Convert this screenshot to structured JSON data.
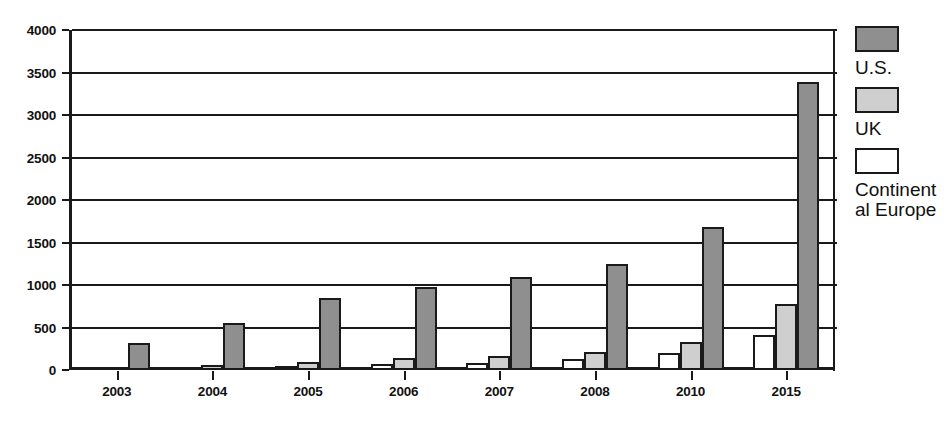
{
  "chart_data": {
    "type": "bar",
    "title": "",
    "subtitle": "",
    "xlabel": "",
    "ylabel": "",
    "categories": [
      "2003",
      "2004",
      "2005",
      "2006",
      "2007",
      "2008",
      "2010",
      "2015"
    ],
    "series": [
      {
        "name": "Continental Europe",
        "key": "ce",
        "color": "#ffffff",
        "values": [
          0,
          10,
          45,
          65,
          80,
          130,
          200,
          410
        ]
      },
      {
        "name": "UK",
        "key": "uk",
        "color": "#cfcfcf",
        "values": [
          0,
          55,
          95,
          140,
          170,
          210,
          330,
          780
        ]
      },
      {
        "name": "U.S.",
        "key": "us",
        "color": "#8f8f8f",
        "values": [
          320,
          550,
          850,
          975,
          1100,
          1250,
          1680,
          3390
        ]
      }
    ],
    "ylim": [
      0,
      4000
    ],
    "ytick_values": [
      0,
      500,
      1000,
      1500,
      2000,
      2500,
      3000,
      3500,
      4000
    ],
    "ytick_labels": [
      "0",
      "500",
      "1000",
      "1500",
      "2000",
      "2500",
      "3000",
      "3500",
      "4000"
    ],
    "grid": true,
    "grid_axis": "y",
    "legend_position": "right",
    "series_order_in_group": [
      "Continental Europe",
      "UK",
      "U.S."
    ],
    "legend_order": [
      "U.S.",
      "UK",
      "Continental Europe"
    ]
  },
  "legend": {
    "entries": [
      {
        "label": "U.S.",
        "key": "us"
      },
      {
        "label": "UK",
        "key": "uk"
      },
      {
        "label": "Continental Europe",
        "key": "ce"
      }
    ]
  },
  "colors": {
    "axis": "#1a1a1a",
    "gridline": "#1a1a1a",
    "text": "#111111",
    "series_us": "#8f8f8f",
    "series_uk": "#cfcfcf",
    "series_ce": "#ffffff",
    "background": "#ffffff"
  }
}
